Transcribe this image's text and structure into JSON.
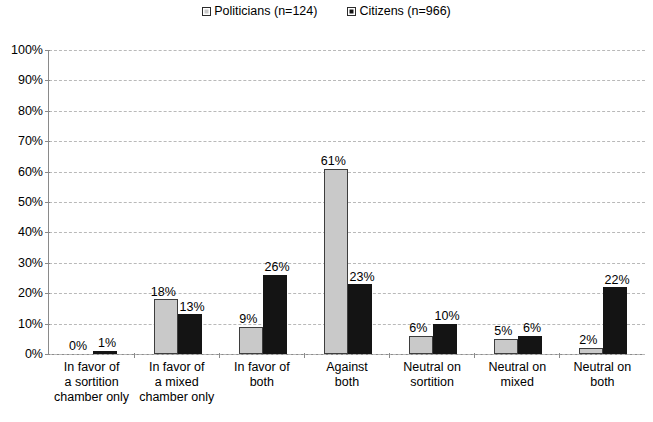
{
  "legend": {
    "entries": [
      {
        "label": "Politicians (n=124)",
        "marker": "square-outline-icon",
        "color": "#c9c9c9"
      },
      {
        "label": "Citizens (n=966)",
        "marker": "square-filled-icon",
        "color": "#141414"
      }
    ]
  },
  "axis": {
    "y_ticks": [
      "100%",
      "90%",
      "80%",
      "70%",
      "60%",
      "50%",
      "40%",
      "30%",
      "20%",
      "10%",
      "0%"
    ]
  },
  "categories": [
    "In favor of a sortition chamber only",
    "In favor of a mixed chamber only",
    "In favor of both",
    "Against both",
    "Neutral on sortition",
    "Neutral on mixed",
    "Neutral on both"
  ],
  "category_lines": [
    [
      "In favor of",
      "a sortition",
      "chamber only"
    ],
    [
      "In favor of",
      "a mixed",
      "chamber only"
    ],
    [
      "In favor of",
      "both"
    ],
    [
      "Against",
      "both"
    ],
    [
      "Neutral on",
      "sortition"
    ],
    [
      "Neutral on",
      "mixed"
    ],
    [
      "Neutral on",
      "both"
    ]
  ],
  "bar_labels": {
    "politicians": [
      "0%",
      "18%",
      "9%",
      "61%",
      "6%",
      "5%",
      "2%"
    ],
    "citizens": [
      "1%",
      "13%",
      "26%",
      "23%",
      "10%",
      "6%",
      "22%"
    ]
  },
  "chart_data": {
    "type": "bar",
    "title": "",
    "xlabel": "",
    "ylabel": "",
    "ylim": [
      0,
      100
    ],
    "grid": true,
    "legend_position": "top-center",
    "categories": [
      "In favor of a sortition chamber only",
      "In favor of a mixed chamber only",
      "In favor of both",
      "Against both",
      "Neutral on sortition",
      "Neutral on mixed",
      "Neutral on both"
    ],
    "series": [
      {
        "name": "Politicians (n=124)",
        "color": "#c9c9c9",
        "values": [
          0,
          18,
          9,
          61,
          6,
          5,
          2
        ]
      },
      {
        "name": "Citizens (n=966)",
        "color": "#141414",
        "values": [
          1,
          13,
          26,
          23,
          10,
          6,
          22
        ]
      }
    ],
    "ytick_labels": [
      "0%",
      "10%",
      "20%",
      "30%",
      "40%",
      "50%",
      "60%",
      "70%",
      "80%",
      "90%",
      "100%"
    ]
  }
}
